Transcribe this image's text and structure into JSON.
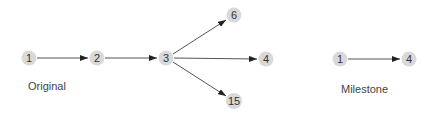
{
  "diagrams": [
    {
      "caption": "Original",
      "nodes": [
        {
          "id": "o1",
          "label": "1",
          "x": 29,
          "y": 58
        },
        {
          "id": "o2",
          "label": "2",
          "x": 97,
          "y": 58
        },
        {
          "id": "o3",
          "label": "3",
          "x": 166,
          "y": 58
        },
        {
          "id": "o6",
          "label": "6",
          "x": 234,
          "y": 15
        },
        {
          "id": "o4",
          "label": "4",
          "x": 266,
          "y": 59
        },
        {
          "id": "o15",
          "label": "15",
          "x": 234,
          "y": 101
        }
      ],
      "edges": [
        [
          "o1",
          "o2"
        ],
        [
          "o2",
          "o3"
        ],
        [
          "o3",
          "o6"
        ],
        [
          "o3",
          "o4"
        ],
        [
          "o3",
          "o15"
        ]
      ]
    },
    {
      "caption": "Milestone",
      "nodes": [
        {
          "id": "m1",
          "label": "1",
          "x": 340,
          "y": 59
        },
        {
          "id": "m4",
          "label": "4",
          "x": 409,
          "y": 59
        }
      ],
      "edges": [
        [
          "m1",
          "m4"
        ]
      ]
    }
  ],
  "captions": {
    "original": "Original",
    "milestone": "Milestone"
  },
  "colors": {
    "node_fill": "#d9d9d9",
    "edge": "#555555",
    "text": "#333333"
  }
}
